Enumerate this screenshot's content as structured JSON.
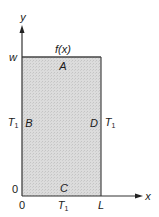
{
  "diagram": {
    "type": "rectangular-domain-boundary-conditions",
    "colors": {
      "background": "#ffffff",
      "region_fill": "#d9d9d9",
      "outline": "#333333",
      "text": "#1a1a1a"
    },
    "axes": {
      "x_label": "x",
      "y_label": "y"
    },
    "ticks": {
      "x_origin": "0",
      "x_end": "L",
      "y_origin": "0",
      "y_top": "w"
    },
    "region": {
      "top_function": "f(x)",
      "sides": {
        "top": "A",
        "left": "B",
        "bottom": "C",
        "right": "D"
      }
    },
    "boundary_values": {
      "left": {
        "base": "T",
        "sub": "1"
      },
      "right": {
        "base": "T",
        "sub": "1"
      },
      "bottom": {
        "base": "T",
        "sub": "1"
      }
    }
  }
}
